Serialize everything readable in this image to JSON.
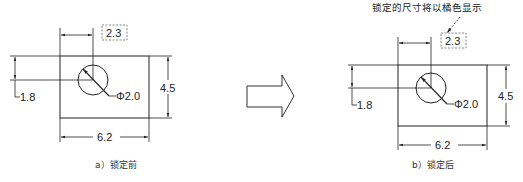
{
  "annotation": {
    "text": "锁定的尺寸将以橘色显示"
  },
  "figures": [
    {
      "id": "a",
      "caption": "a）锁定前",
      "dimensions": {
        "horizontal_top": "2.3",
        "vertical_left": "1.8",
        "vertical_right": "4.5",
        "horizontal_bottom": "6.2",
        "diameter": "Φ2.0"
      }
    },
    {
      "id": "b",
      "caption": "b）锁定后",
      "dimensions": {
        "horizontal_top": "2.3",
        "vertical_left": "1.8",
        "vertical_right": "4.5",
        "horizontal_bottom": "6.2",
        "diameter": "Φ2.0"
      }
    }
  ],
  "colors": {
    "line": "#222222",
    "dashed_box": "#555555",
    "background": "#ffffff"
  }
}
